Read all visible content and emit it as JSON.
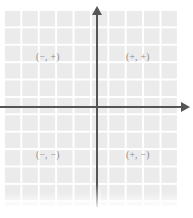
{
  "figure": {
    "title": "",
    "type": "coordinate-plane-quadrant-signs",
    "width": 193,
    "height": 218,
    "background_color": "#ffffff"
  },
  "grid": {
    "cell_color": "#ebebeb",
    "line_color": "#ffffff",
    "cell_size_px": 17.4,
    "visible": true
  },
  "axes": {
    "color": "#555555",
    "thickness_px": 2,
    "x_axis": {
      "name": "horizontal-axis",
      "label": "",
      "arrow_direction": "right"
    },
    "y_axis": {
      "name": "vertical-axis",
      "label": "",
      "arrow_direction": "up"
    },
    "origin": {
      "x_px": 97,
      "y_px": 107
    }
  },
  "quadrants": {
    "label_color": "#8b8b8b",
    "q1": {
      "name": "quadrant-one",
      "label": "(+, +)",
      "x_sign": "+",
      "y_sign": "+"
    },
    "q2": {
      "name": "quadrant-two",
      "label": "(−, +)",
      "x_sign": "−",
      "y_sign": "+"
    },
    "q3": {
      "name": "quadrant-three",
      "label": "(−, −)",
      "x_sign": "−",
      "y_sign": "−"
    },
    "q4": {
      "name": "quadrant-four",
      "label": "(+, −)",
      "x_sign": "+",
      "y_sign": "−"
    }
  },
  "chart_data": {
    "type": "scatter",
    "title": "",
    "xlabel": "",
    "ylabel": "",
    "xlim": [
      -5.5,
      5.5
    ],
    "ylim": [
      -5.5,
      5.5
    ],
    "grid": true,
    "legend": null,
    "x": [],
    "y": [],
    "annotations": [
      {
        "text": "(−, +)",
        "x": -2.8,
        "y": 3.0
      },
      {
        "text": "(+, +)",
        "x": 2.4,
        "y": 3.0
      },
      {
        "text": "(−, −)",
        "x": -2.8,
        "y": -2.9
      },
      {
        "text": "(+, −)",
        "x": 2.4,
        "y": -2.9
      }
    ]
  }
}
